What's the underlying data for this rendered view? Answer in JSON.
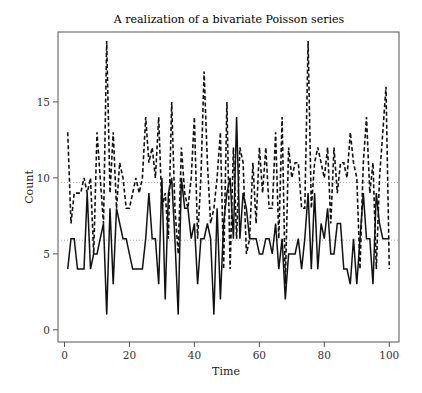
{
  "chart_data": {
    "type": "line",
    "title": "A realization of a bivariate Poisson series",
    "xlabel": "Time",
    "ylabel": "Count",
    "xlim": [
      -2,
      103
    ],
    "ylim": [
      -0.8,
      19.6
    ],
    "xticks": [
      0,
      20,
      40,
      60,
      80,
      100
    ],
    "yticks": [
      0,
      5,
      10,
      15
    ],
    "grid": false,
    "legend": null,
    "reference_lines": [
      {
        "y": 9.7,
        "style": "dotted",
        "note": "mean of dashed series"
      },
      {
        "y": 5.9,
        "style": "dotted",
        "note": "mean of solid series"
      }
    ],
    "x": [
      1,
      2,
      3,
      4,
      5,
      6,
      7,
      8,
      9,
      10,
      11,
      12,
      13,
      14,
      15,
      16,
      17,
      18,
      19,
      20,
      21,
      22,
      23,
      24,
      25,
      26,
      27,
      28,
      29,
      30,
      31,
      32,
      33,
      34,
      35,
      36,
      37,
      38,
      39,
      40,
      41,
      42,
      43,
      44,
      45,
      46,
      47,
      48,
      49,
      50,
      51,
      52,
      53,
      54,
      55,
      56,
      57,
      58,
      59,
      60,
      61,
      62,
      63,
      64,
      65,
      66,
      67,
      68,
      69,
      70,
      71,
      72,
      73,
      74,
      75,
      76,
      77,
      78,
      79,
      80,
      81,
      82,
      83,
      84,
      85,
      86,
      87,
      88,
      89,
      90,
      91,
      92,
      93,
      94,
      95,
      96,
      97,
      98,
      99,
      100
    ],
    "series": [
      {
        "name": "Series 1 (solid)",
        "style": "solid",
        "values": [
          4,
          6,
          6,
          4,
          4,
          4,
          9,
          4,
          5,
          5,
          6,
          7,
          1,
          8,
          3,
          8,
          7,
          6,
          6,
          5,
          4,
          4,
          4,
          4,
          6,
          9,
          6,
          6,
          3,
          10,
          2,
          9,
          10,
          6,
          1,
          10,
          8,
          8,
          6,
          7,
          3,
          6,
          6,
          7,
          6,
          1,
          8,
          2,
          7,
          9,
          10,
          6,
          14,
          6,
          9,
          8,
          6,
          6,
          6,
          5,
          5,
          6,
          6,
          5,
          7,
          4,
          6,
          2,
          5,
          5,
          5,
          6,
          4,
          6,
          9,
          4,
          9,
          4,
          7,
          6,
          8,
          5,
          5,
          7,
          7,
          4,
          4,
          3,
          6,
          3,
          6,
          9,
          6,
          6,
          3,
          9,
          7,
          6,
          6,
          6
        ]
      },
      {
        "name": "Series 2 (dashed)",
        "style": "dashed",
        "values": [
          13,
          7,
          9,
          9,
          9,
          10,
          9,
          10,
          5,
          13,
          10,
          7,
          19,
          9,
          13,
          8,
          11,
          10,
          8,
          8,
          9,
          10,
          9,
          10,
          14,
          11,
          12,
          10,
          14,
          8,
          9,
          6,
          15,
          8,
          5,
          12,
          9,
          8,
          10,
          14,
          6,
          10,
          17,
          11,
          7,
          8,
          10,
          13,
          4,
          15,
          4,
          12,
          6,
          12,
          11,
          5,
          6,
          11,
          7,
          12,
          9,
          12,
          8,
          8,
          13,
          6,
          14,
          3,
          12,
          10,
          11,
          11,
          8,
          8,
          19,
          8,
          11,
          12,
          11,
          10,
          12,
          7,
          12,
          9,
          11,
          11,
          10,
          13,
          11,
          10,
          4,
          11,
          14,
          9,
          11,
          4,
          10,
          13,
          16,
          4
        ]
      }
    ]
  }
}
